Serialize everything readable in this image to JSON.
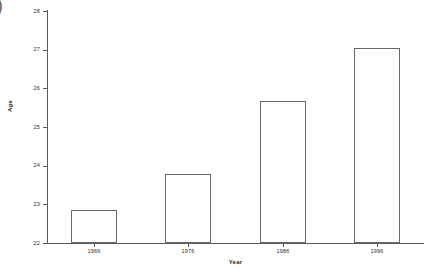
{
  "corner_artifact": ")",
  "chart_data": {
    "type": "bar",
    "title": "",
    "xlabel": "Year",
    "ylabel": "Age",
    "categories": [
      "1966",
      "1976",
      "1986",
      "1996"
    ],
    "values": [
      22.85,
      23.78,
      25.67,
      27.04
    ],
    "ylim": [
      22,
      28
    ],
    "yticks": [
      22,
      23,
      24,
      25,
      26,
      27,
      28
    ],
    "ytick_labels": [
      "22",
      "23",
      "24",
      "25",
      "26",
      "27",
      "28"
    ],
    "grid": false,
    "legend": false,
    "bar_style": {
      "fill": "#ffffff",
      "edge": "#666666"
    },
    "axis_color": "#5a5a5a",
    "text_color": "#1f1f1f"
  }
}
